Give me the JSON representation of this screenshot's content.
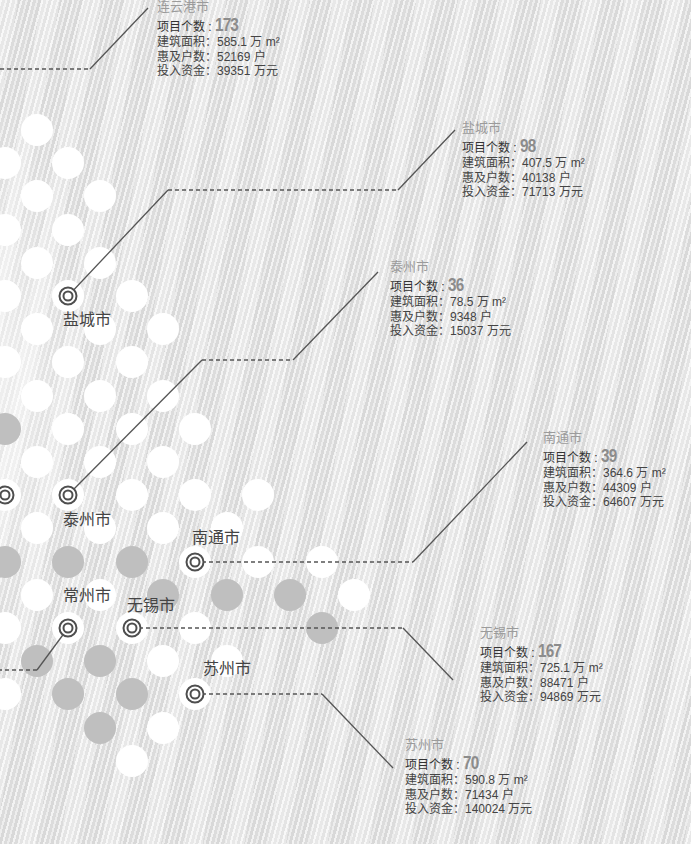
{
  "colors": {
    "background": "#ebebeb",
    "dot_white": "#ffffff",
    "dot_gray": "#bfbfbf",
    "line": "#555555",
    "title_gray": "#9b9b9b",
    "count_gray": "#8c8c8c",
    "text": "#444444"
  },
  "map_labels": {
    "yancheng": "盐城市",
    "taizhou": "泰州市",
    "nantong": "南通市",
    "changzhou": "常州市",
    "wuxi": "无锡市",
    "suzhou": "苏州市"
  },
  "cities": {
    "lianyungang": {
      "name": "连云港市",
      "count_label": "项目个数 : ",
      "count": "173",
      "area_label": "建筑面积：",
      "area_value": "585.1 万 m²",
      "households_label": "惠及户数：",
      "households_value": "52169 户",
      "investment_label": "投入资金：",
      "investment_value": "39351 万元"
    },
    "yancheng": {
      "name": "盐城市",
      "count_label": "项目个数 : ",
      "count": "98",
      "area_label": "建筑面积：",
      "area_value": "407.5 万 m²",
      "households_label": "惠及户数：",
      "households_value": "40138 户",
      "investment_label": "投入资金：",
      "investment_value": "71713 万元"
    },
    "taizhou": {
      "name": "泰州市",
      "count_label": "项目个数 : ",
      "count": "36",
      "area_label": "建筑面积：",
      "area_value": "78.5 万 m²",
      "households_label": "惠及户数：",
      "households_value": "9348 户",
      "investment_label": "投入资金：",
      "investment_value": "15037 万元"
    },
    "nantong": {
      "name": "南通市",
      "count_label": "项目个数 : ",
      "count": "39",
      "area_label": "建筑面积：",
      "area_value": "364.6 万 m²",
      "households_label": "惠及户数：",
      "households_value": "44309 户",
      "investment_label": "投入资金：",
      "investment_value": "64607 万元"
    },
    "wuxi": {
      "name": "无锡市",
      "count_label": "项目个数 : ",
      "count": "167",
      "area_label": "建筑面积：",
      "area_value": "725.1 万 m²",
      "households_label": "惠及户数：",
      "households_value": "88471 户",
      "investment_label": "投入资金：",
      "investment_value": "94869 万元"
    },
    "suzhou": {
      "name": "苏州市",
      "count_label": "项目个数 : ",
      "count": "70",
      "area_label": "建筑面积：",
      "area_value": "590.8 万 m²",
      "households_label": "惠及户数：",
      "households_value": "71434 户",
      "investment_label": "投入资金：",
      "investment_value": "140024 万元"
    }
  }
}
